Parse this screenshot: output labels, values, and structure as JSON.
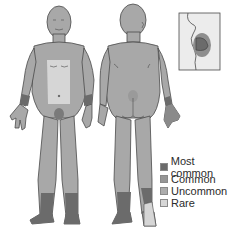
{
  "figure": {
    "views": [
      "front-body",
      "back-body",
      "lip-inset"
    ],
    "colors": {
      "body": "#a8a8a8",
      "outline": "#4a4a4a",
      "most_common": "#6b6b6b",
      "common": "#969696",
      "uncommon": "#acacac",
      "rare": "#d6d6d6"
    }
  },
  "legend": {
    "items": [
      {
        "label": "Most common",
        "color": "#6b6b6b"
      },
      {
        "label": "Common",
        "color": "#969696"
      },
      {
        "label": "Uncommon",
        "color": "#acacac"
      },
      {
        "label": "Rare",
        "color": "#d6d6d6"
      }
    ]
  }
}
